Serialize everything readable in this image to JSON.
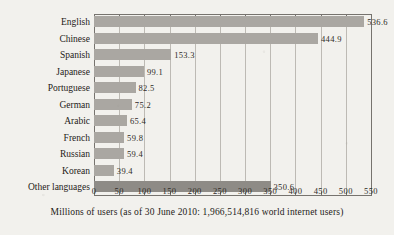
{
  "chart_data": {
    "type": "bar",
    "orientation": "horizontal",
    "title": "",
    "xlabel": "Millions of users (as of 30 June 2010: 1,966,514,816 world internet users)",
    "ylabel": "",
    "xlim": [
      0,
      550
    ],
    "xtick_step": 50,
    "grid": true,
    "legend": null,
    "categories": [
      "English",
      "Chinese",
      "Spanish",
      "Japanese",
      "Portuguese",
      "German",
      "Arabic",
      "French",
      "Russian",
      "Korean",
      "Other languages"
    ],
    "values": [
      536.6,
      444.9,
      153.3,
      99.1,
      82.5,
      75.2,
      65.4,
      59.8,
      59.4,
      39.4,
      350.6
    ],
    "value_labels": [
      "536.6",
      "444.9",
      "153.3",
      "99.1",
      "82.5",
      "75.2",
      "65.4",
      "59.8",
      "59.4",
      "39.4",
      "350.6"
    ],
    "xticks": [
      0,
      50,
      100,
      150,
      200,
      250,
      300,
      350,
      400,
      450,
      500,
      550
    ],
    "xtick_labels": [
      "0",
      "50",
      "100",
      "150",
      "200",
      "250",
      "300",
      "350",
      "400",
      "450",
      "500",
      "550"
    ],
    "bar_color": "#aaa7a2",
    "bar_color_other": "#8e8b86",
    "background_color": "#f2f1ed",
    "axis_color": "#76736e",
    "gridline_color": "#bdbab4"
  },
  "caption": {
    "text": "Millions of users (as of 30 June 2010: 1,966,514,816 world internet users)"
  }
}
